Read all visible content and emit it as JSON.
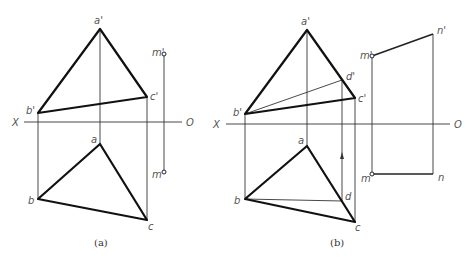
{
  "figure_a": {
    "caption": "(a)",
    "axis": {
      "x_label": "X",
      "o_label": "O"
    },
    "labels": {
      "a_prime": "a'",
      "b_prime": "b'",
      "c_prime": "c'",
      "m_prime": "m'",
      "a": "a",
      "b": "b",
      "c": "c",
      "m": "m"
    }
  },
  "figure_b": {
    "caption": "(b)",
    "axis": {
      "x_label": "X",
      "o_label": "O"
    },
    "labels": {
      "a_prime": "a'",
      "b_prime": "b'",
      "c_prime": "c'",
      "d_prime": "d'",
      "m_prime": "m'",
      "n_prime": "n'",
      "a": "a",
      "b": "b",
      "c": "c",
      "d": "d",
      "m": "m",
      "n": "n"
    }
  }
}
